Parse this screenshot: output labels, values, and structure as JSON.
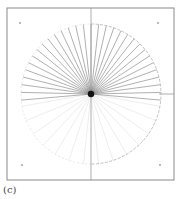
{
  "figure": {
    "panel_label": "(c)",
    "frame": {
      "x": 7,
      "y": 8,
      "width": 167,
      "height": 172,
      "stroke": "#8a8a8a"
    },
    "center": {
      "x": 91,
      "y": 94
    },
    "radius": 70,
    "axes": {
      "stroke": "#9a9a9a"
    },
    "corner_markers": [
      {
        "x": 20,
        "y": 23
      },
      {
        "x": 158,
        "y": 23
      },
      {
        "x": 22,
        "y": 165
      },
      {
        "x": 160,
        "y": 165
      }
    ],
    "solid_rays": {
      "count": 31,
      "start_angle_deg": -95,
      "end_angle_deg": 95,
      "stroke": "#7a7a7a"
    },
    "faint_rays": {
      "count": 14,
      "start_angle_deg": 100,
      "end_angle_deg": 260,
      "stroke": "#e0e0e0"
    },
    "arc_color_right": "#b0b0b0",
    "arc_color_left": "#dcdcdc",
    "center_blob_color": "#111111"
  }
}
